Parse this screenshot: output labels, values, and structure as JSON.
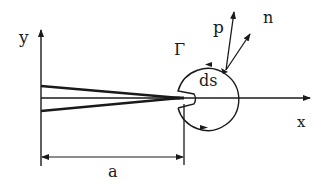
{
  "figure": {
    "type": "crack contour integral schematic",
    "labels": {
      "y_axis": "y",
      "x_axis": "x",
      "contour": "Γ",
      "traction_vector": "p",
      "normal_vector": "n",
      "arc_element": "ds",
      "crack_length": "a"
    },
    "colors": {
      "line": "#1a1a1a",
      "background": "#ffffff"
    }
  }
}
